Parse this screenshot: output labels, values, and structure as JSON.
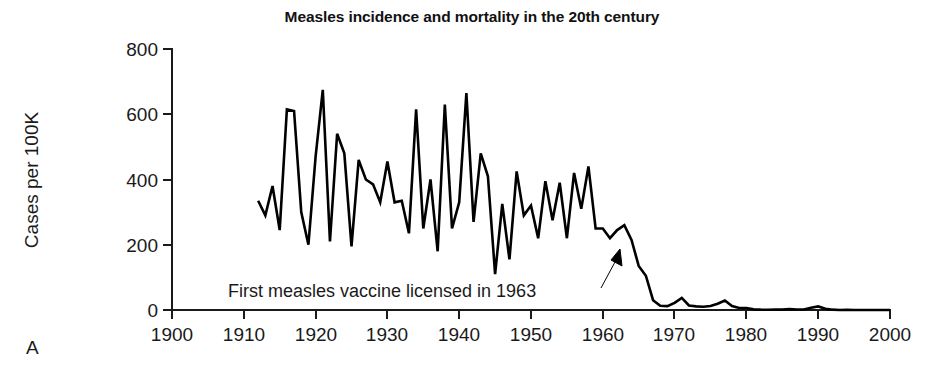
{
  "figure": {
    "panel_label": "A",
    "background_color": "#ffffff",
    "line_color": "#000000"
  },
  "chart_data": {
    "type": "line",
    "title": "Measles incidence and mortality in the 20th century",
    "xlabel": "",
    "ylabel": "Cases per 100K",
    "xlim": [
      1900,
      2000
    ],
    "ylim": [
      0,
      800
    ],
    "xticks": [
      1900,
      1910,
      1920,
      1930,
      1940,
      1950,
      1960,
      1970,
      1980,
      1990,
      2000
    ],
    "xticklabels": [
      "1900",
      "1910",
      "1920",
      "1930",
      "1940",
      "1950",
      "1960",
      "1970",
      "1980",
      "1990",
      "2000"
    ],
    "yticks": [
      0,
      200,
      400,
      600,
      800
    ],
    "yticklabels": [
      "0",
      "200",
      "400",
      "600",
      "800"
    ],
    "grid": false,
    "legend": false,
    "series": [
      {
        "name": "Measles cases per 100K",
        "x": [
          1912,
          1913,
          1914,
          1915,
          1916,
          1917,
          1918,
          1919,
          1920,
          1921,
          1922,
          1923,
          1924,
          1925,
          1926,
          1927,
          1928,
          1929,
          1930,
          1931,
          1932,
          1933,
          1934,
          1935,
          1936,
          1937,
          1938,
          1939,
          1940,
          1941,
          1942,
          1943,
          1944,
          1945,
          1946,
          1947,
          1948,
          1949,
          1950,
          1951,
          1952,
          1953,
          1954,
          1955,
          1956,
          1957,
          1958,
          1959,
          1960,
          1961,
          1962,
          1963,
          1964,
          1965,
          1966,
          1967,
          1968,
          1969,
          1970,
          1971,
          1972,
          1973,
          1974,
          1975,
          1976,
          1977,
          1978,
          1979,
          1980,
          1981,
          1982,
          1983,
          1984,
          1985,
          1986,
          1987,
          1988,
          1989,
          1990,
          1991,
          1992,
          1993,
          1994,
          1995,
          1996,
          1997,
          1998,
          1999,
          2000
        ],
        "y": [
          335,
          290,
          380,
          245,
          615,
          610,
          300,
          200,
          470,
          675,
          210,
          540,
          480,
          195,
          460,
          400,
          385,
          330,
          455,
          330,
          335,
          235,
          615,
          250,
          400,
          180,
          630,
          250,
          330,
          665,
          270,
          480,
          410,
          110,
          325,
          155,
          425,
          290,
          320,
          220,
          395,
          275,
          390,
          220,
          420,
          310,
          440,
          250,
          250,
          220,
          245,
          260,
          215,
          135,
          105,
          30,
          13,
          12,
          22,
          37,
          14,
          11,
          10,
          12,
          19,
          29,
          12,
          6,
          6,
          2,
          1,
          0.6,
          1.1,
          1.2,
          2.6,
          1.5,
          1.4,
          7,
          11,
          4,
          1,
          0.2,
          0.4,
          0.1,
          0.2,
          0.1,
          0.1,
          0.1,
          0.1
        ]
      }
    ],
    "annotations": [
      {
        "text": "First measles vaccine licensed in 1963",
        "points_to_year": 1963,
        "arrow": "up-right"
      }
    ]
  }
}
